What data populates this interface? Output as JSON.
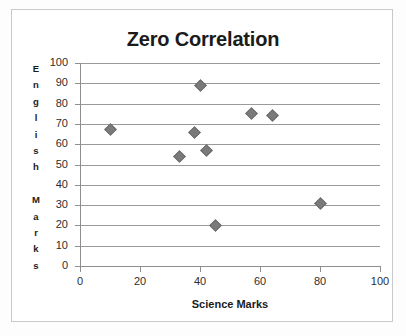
{
  "chart_data": {
    "type": "scatter",
    "title": "Zero Correlation",
    "xlabel": "Science  Marks",
    "ylabel": "English Marks",
    "ylabel_letters": [
      "E",
      "n",
      "g",
      "l",
      "i",
      "s",
      "h",
      "",
      "M",
      "a",
      "r",
      "k",
      "s"
    ],
    "xlim": [
      0,
      100
    ],
    "ylim": [
      0,
      100
    ],
    "xticks": [
      0,
      20,
      40,
      60,
      80,
      100
    ],
    "yticks": [
      0,
      10,
      20,
      30,
      40,
      50,
      60,
      70,
      80,
      90,
      100
    ],
    "grid": "horizontal",
    "legend": "none",
    "series": [
      {
        "name": "Students",
        "marker": "diamond",
        "color": "#7a7a7a",
        "points": [
          {
            "x": 10,
            "y": 67
          },
          {
            "x": 33,
            "y": 54
          },
          {
            "x": 38,
            "y": 66
          },
          {
            "x": 40,
            "y": 89
          },
          {
            "x": 42,
            "y": 57
          },
          {
            "x": 45,
            "y": 20
          },
          {
            "x": 57,
            "y": 75
          },
          {
            "x": 64,
            "y": 74
          },
          {
            "x": 80,
            "y": 31
          }
        ]
      }
    ]
  },
  "style": {
    "gridline_color": "#9a9a9a",
    "axis_color": "#8e8e8e",
    "marker_color": "#7a7a7a",
    "title_color": "#1b1b1b",
    "background": "#ffffff",
    "frame_border": "#c9c9c9"
  }
}
